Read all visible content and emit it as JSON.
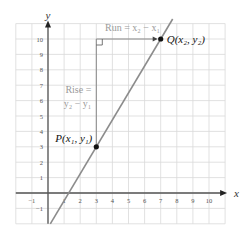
{
  "diagram": {
    "type": "slope-rise-run",
    "x_axis": {
      "label": "x",
      "min": -2,
      "max": 11,
      "ticks": [
        "-1",
        "1",
        "2",
        "3",
        "4",
        "5",
        "6",
        "7",
        "8",
        "9",
        "10"
      ]
    },
    "y_axis": {
      "label": "y",
      "min": -2,
      "max": 11,
      "ticks": [
        "-1",
        "1",
        "2",
        "3",
        "4",
        "5",
        "6",
        "7",
        "8",
        "9",
        "10"
      ]
    },
    "points": {
      "P": {
        "label": "P(x₁, y₁)",
        "x": 3,
        "y": 3
      },
      "Q": {
        "label": "Q(x₂, y₂)",
        "x": 7,
        "y": 10
      }
    },
    "run_label": "Run = x₂ − x₁",
    "rise_label_line1": "Rise =",
    "rise_label_line2": "y₂ − y₁",
    "colors": {
      "grid": "#d9d9d9",
      "axis": "#555555",
      "line": "#8c8c8c",
      "guide": "#888888",
      "label_gray": "#9a9a9a",
      "point": "#111111"
    }
  }
}
